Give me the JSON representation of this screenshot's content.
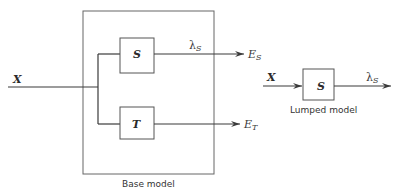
{
  "diagram": {
    "base_model": {
      "caption": "Base model",
      "input_label": "X",
      "blocks": [
        {
          "id": "S",
          "label": "S"
        },
        {
          "id": "T",
          "label": "T"
        }
      ],
      "signals": {
        "s_output_label": "λ",
        "s_output_sub": "S",
        "s_output_target": "E",
        "s_output_target_sub": "S",
        "t_output_target": "E",
        "t_output_target_sub": "T"
      }
    },
    "lumped_model": {
      "caption": "Lumped model",
      "input_label": "X",
      "block_label": "S",
      "output_label": "λ",
      "output_sub": "S"
    }
  }
}
